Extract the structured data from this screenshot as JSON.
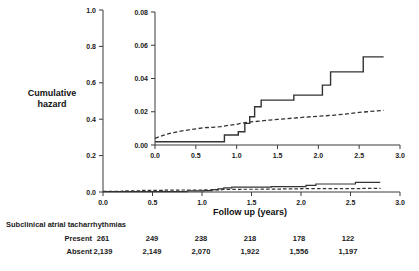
{
  "figure": {
    "y_axis_label": "Cumulative\nhazard",
    "y_axis_label_line1": "Cumulative",
    "y_axis_label_line2": "hazard",
    "x_axis_label": "Follow up (years)"
  },
  "risk_table": {
    "title": "Subclinical atrial tacharrhythmias",
    "rows": [
      {
        "label": "Present",
        "values": [
          "261",
          "249",
          "238",
          "218",
          "178",
          "122"
        ]
      },
      {
        "label": "Absent",
        "values": [
          "2,139",
          "2,149",
          "2,070",
          "1,922",
          "1,556",
          "1,197"
        ]
      }
    ]
  },
  "chart_data": [
    {
      "id": "main",
      "type": "line",
      "title": "",
      "xlabel": "Follow up (years)",
      "ylabel": "Cumulative hazard",
      "xlim": [
        0.0,
        3.0
      ],
      "ylim": [
        0.0,
        1.0
      ],
      "xticks": [
        0.0,
        0.5,
        1.0,
        1.5,
        2.0,
        2.5,
        3.0
      ],
      "xticklabels": [
        "0.0",
        "0.5",
        "1.0",
        "1.5",
        "2.0",
        "2.5",
        "3.0"
      ],
      "yticks": [
        0.0,
        0.2,
        0.4,
        0.6,
        0.8,
        1.0
      ],
      "yticklabels": [
        "0.0",
        "0.2",
        "0.4",
        "0.6",
        "0.8",
        "1.0"
      ],
      "grid": false,
      "legend": "none",
      "series": [
        {
          "name": "Subclinical atrial tacharrhythmias present",
          "style": "solid",
          "color": "#333333",
          "drawstyle": "steps-post",
          "x": [
            0.0,
            0.85,
            0.85,
            1.02,
            1.02,
            1.1,
            1.1,
            1.16,
            1.16,
            1.22,
            1.22,
            1.3,
            1.3,
            1.7,
            1.7,
            2.05,
            2.05,
            2.15,
            2.15,
            2.55,
            2.55,
            2.8
          ],
          "y": [
            0.002,
            0.002,
            0.006,
            0.006,
            0.008,
            0.008,
            0.013,
            0.013,
            0.017,
            0.017,
            0.023,
            0.023,
            0.027,
            0.027,
            0.03,
            0.03,
            0.036,
            0.036,
            0.044,
            0.044,
            0.053,
            0.053
          ]
        },
        {
          "name": "Subclinical atrial tacharrhythmias absent",
          "style": "dashed",
          "color": "#333333",
          "drawstyle": "steps-post",
          "x": [
            0.0,
            0.2,
            0.4,
            0.6,
            0.8,
            1.0,
            1.2,
            1.4,
            1.6,
            1.8,
            2.0,
            2.2,
            2.4,
            2.6,
            2.8
          ],
          "y": [
            0.004,
            0.007,
            0.009,
            0.01,
            0.011,
            0.012,
            0.014,
            0.015,
            0.016,
            0.017,
            0.018,
            0.018,
            0.019,
            0.02,
            0.021
          ]
        }
      ]
    },
    {
      "id": "inset",
      "type": "line",
      "title": "",
      "xlabel": "",
      "ylabel": "",
      "xlim": [
        0.0,
        3.0
      ],
      "ylim": [
        0.0,
        0.08
      ],
      "xticks": [
        0.0,
        0.5,
        1.0,
        1.5,
        2.0,
        2.5,
        3.0
      ],
      "xticklabels": [
        "0.0",
        "0.5",
        "1.0",
        "1.5",
        "2.0",
        "2.5",
        "3.0"
      ],
      "yticks": [
        0.0,
        0.02,
        0.04,
        0.06,
        0.08
      ],
      "yticklabels": [
        "0.00",
        "0.02",
        "0.04",
        "0.06",
        "0.08"
      ],
      "grid": false,
      "legend": "none",
      "series": [
        {
          "name": "Subclinical atrial tacharrhythmias present",
          "style": "solid",
          "color": "#333333",
          "drawstyle": "steps-post",
          "x": [
            0.0,
            0.85,
            0.85,
            1.02,
            1.02,
            1.1,
            1.1,
            1.16,
            1.16,
            1.22,
            1.22,
            1.3,
            1.3,
            1.7,
            1.7,
            2.05,
            2.05,
            2.15,
            2.15,
            2.55,
            2.55,
            2.8
          ],
          "y": [
            0.002,
            0.002,
            0.006,
            0.006,
            0.008,
            0.008,
            0.013,
            0.013,
            0.017,
            0.017,
            0.023,
            0.023,
            0.027,
            0.027,
            0.03,
            0.03,
            0.036,
            0.036,
            0.044,
            0.044,
            0.053,
            0.053
          ]
        },
        {
          "name": "Subclinical atrial tacharrhythmias absent",
          "style": "dashed",
          "color": "#333333",
          "drawstyle": "steps-post",
          "x": [
            0.0,
            0.1,
            0.2,
            0.3,
            0.4,
            0.5,
            0.6,
            0.7,
            0.8,
            0.9,
            1.0,
            1.05,
            1.1,
            1.2,
            1.3,
            1.4,
            1.5,
            1.6,
            1.7,
            1.8,
            1.9,
            2.0,
            2.1,
            2.2,
            2.3,
            2.4,
            2.5,
            2.6,
            2.7,
            2.8
          ],
          "y": [
            0.004,
            0.0058,
            0.0072,
            0.0082,
            0.009,
            0.0097,
            0.0104,
            0.0106,
            0.011,
            0.0118,
            0.0124,
            0.013,
            0.0134,
            0.014,
            0.0144,
            0.015,
            0.0154,
            0.0158,
            0.0162,
            0.0166,
            0.017,
            0.0173,
            0.0176,
            0.018,
            0.0185,
            0.019,
            0.0196,
            0.02,
            0.0205,
            0.0208
          ]
        }
      ]
    }
  ]
}
